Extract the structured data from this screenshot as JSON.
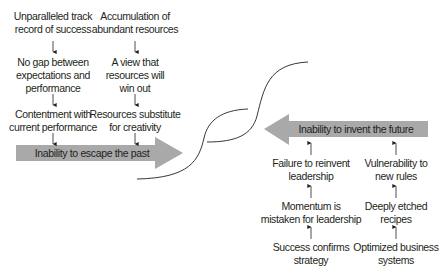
{
  "colors": {
    "arrow_fill": "#a9a9a9",
    "text": "#231f20",
    "curve": "#231f20"
  },
  "left_panel": {
    "banner": "Inability to escape the past",
    "columns": [
      {
        "items": [
          [
            "Unparalleled track",
            "record of success"
          ],
          [
            "No gap between",
            "expectations and",
            "performance"
          ],
          [
            "Contentment with",
            "current performance"
          ]
        ]
      },
      {
        "items": [
          [
            "Accumulation of",
            "abundant resources"
          ],
          [
            "A view that",
            "resources will",
            "win out"
          ],
          [
            "Resources substitute",
            "for creativity"
          ]
        ]
      }
    ]
  },
  "right_panel": {
    "banner": "Inability to invent the future",
    "columns": [
      {
        "items": [
          [
            "Failure to reinvent",
            "leadership"
          ],
          [
            "Momentum is",
            "mistaken for leadership"
          ],
          [
            "Success confirms",
            "strategy"
          ]
        ]
      },
      {
        "items": [
          [
            "Vulnerability to",
            "new rules"
          ],
          [
            "Deeply etched",
            "recipes"
          ],
          [
            "Optimized business",
            "systems"
          ]
        ]
      }
    ]
  }
}
